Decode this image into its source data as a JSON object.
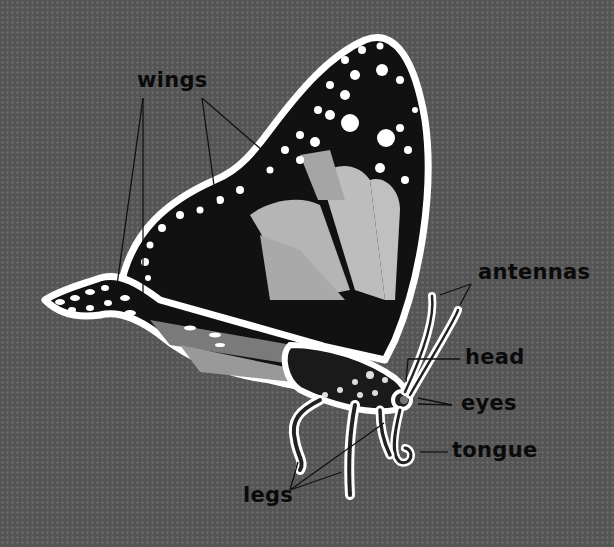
{
  "diagram": {
    "colors": {
      "background": "#555555",
      "wing_black": "#111111",
      "wing_panel": "#b8b8b8",
      "outline": "#ffffff",
      "label_text": "#0a0a0a"
    },
    "labels": {
      "wings": "wings",
      "antennas": "antennas",
      "head": "head",
      "eyes": "eyes",
      "tongue": "tongue",
      "legs": "legs"
    }
  }
}
